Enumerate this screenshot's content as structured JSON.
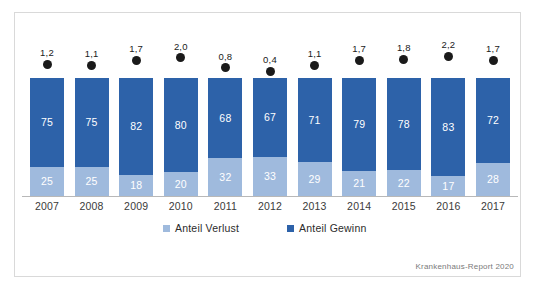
{
  "chart_data": {
    "type": "bar",
    "subtype": "stacked-100-percent",
    "title": "",
    "subtitle": "",
    "xlabel": "",
    "ylabel": "",
    "ylim": [
      0,
      100
    ],
    "grid": false,
    "legend_position": "bottom",
    "categories": [
      "2007",
      "2008",
      "2009",
      "2010",
      "2011",
      "2012",
      "2013",
      "2014",
      "2015",
      "2016",
      "2017"
    ],
    "series": [
      {
        "name": "Anteil Verlust",
        "color": "#9FBADD",
        "values": [
          25,
          25,
          18,
          20,
          32,
          33,
          29,
          21,
          22,
          17,
          28
        ]
      },
      {
        "name": "Anteil Gewinn",
        "color": "#2D62A9",
        "values": [
          75,
          75,
          82,
          80,
          68,
          67,
          71,
          79,
          78,
          83,
          72
        ]
      }
    ],
    "point_series": {
      "name": "Punktwerte",
      "color": "#1a1a1a",
      "marker": "circle",
      "labels": [
        "1,2",
        "1,1",
        "1,7",
        "2,0",
        "0,8",
        "0,4",
        "1,1",
        "1,7",
        "1,8",
        "2,2",
        "1,7"
      ],
      "values": [
        1.2,
        1.1,
        1.7,
        2.0,
        0.8,
        0.4,
        1.1,
        1.7,
        1.8,
        2.2,
        1.7
      ],
      "value_range": [
        0.4,
        2.2
      ]
    },
    "annotations": {
      "source": "Krankenhaus-Report 2020"
    }
  },
  "legend": {
    "items": [
      {
        "label": "Anteil Verlust",
        "color": "#9FBADD"
      },
      {
        "label": "Anteil Gewinn",
        "color": "#2D62A9"
      }
    ]
  },
  "source_note": "Krankenhaus-Report 2020"
}
